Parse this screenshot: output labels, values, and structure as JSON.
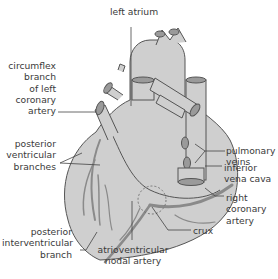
{
  "diagram": {
    "colors": {
      "heart_fill": "#cfcfcf",
      "outline": "#555555",
      "vessel": "#8a8a8a",
      "leader_line": "#444444",
      "text": "#3a3a3a",
      "background": "#ffffff"
    },
    "labels": {
      "left_atrium": "left atrium",
      "circumflex": "circumflex\nbranch\nof left\ncoronary\nartery",
      "posterior_ventricular": "posterior\nventricular\nbranches",
      "posterior_interventricular": "posterior\ninterventricular\nbranch",
      "av_nodal": "atrioventricular\nnodal artery",
      "crux": "crux",
      "right_coronary": "right\ncoronary\nartery",
      "inferior_vena_cava": "inferior\nvena cava",
      "pulmonary_veins": "pulmonary\nveins"
    }
  }
}
